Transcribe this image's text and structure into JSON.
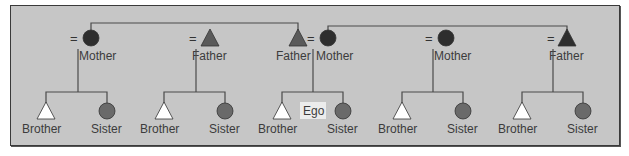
{
  "diagram": {
    "colors": {
      "background": "#c6c6c6",
      "border": "#3a3a3a",
      "line": "#4a4a4a",
      "parent_dark": "#2e2e2e",
      "parent_mid": "#5a5a5a",
      "sibling_female": "#6a6a6a",
      "sibling_male": "#ffffff",
      "ego_box": "#ececec"
    },
    "symbol_legend": {
      "triangle": "male",
      "circle": "female",
      "equals": "marriage"
    },
    "parents": [
      {
        "id": "p1",
        "label": "Mother",
        "shape": "circle",
        "x": 91,
        "y": 38,
        "eq_x": 75
      },
      {
        "id": "p2",
        "label": "Father",
        "shape": "triangle",
        "x": 210,
        "y": 38,
        "eq_x": 194
      },
      {
        "id": "p3",
        "label": "Father",
        "shape": "triangle",
        "x": 298,
        "y": 38,
        "eq_x": 312
      },
      {
        "id": "p4",
        "label": "Mother",
        "shape": "circle",
        "x": 328,
        "y": 38,
        "eq_x": 312
      },
      {
        "id": "p5",
        "label": "Mother",
        "shape": "circle",
        "x": 446,
        "y": 38,
        "eq_x": 430
      },
      {
        "id": "p6",
        "label": "Father",
        "shape": "triangle",
        "x": 567,
        "y": 38,
        "eq_x": 552
      }
    ],
    "families": [
      {
        "drop_x": 78,
        "children": [
          {
            "label": "Brother",
            "shape": "triangle",
            "x": 46
          },
          {
            "label": "Sister",
            "shape": "circle",
            "x": 107
          }
        ]
      },
      {
        "drop_x": 196,
        "children": [
          {
            "label": "Brother",
            "shape": "triangle",
            "x": 164
          },
          {
            "label": "Sister",
            "shape": "circle",
            "x": 225
          }
        ]
      },
      {
        "drop_x": 313,
        "children": [
          {
            "label": "Brother",
            "shape": "triangle",
            "x": 282
          },
          {
            "label": "Sister",
            "shape": "circle",
            "x": 343
          }
        ],
        "ego": {
          "label": "Ego",
          "x": 313
        }
      },
      {
        "drop_x": 433,
        "children": [
          {
            "label": "Brother",
            "shape": "triangle",
            "x": 402
          },
          {
            "label": "Sister",
            "shape": "circle",
            "x": 463
          }
        ]
      },
      {
        "drop_x": 553,
        "children": [
          {
            "label": "Brother",
            "shape": "triangle",
            "x": 522
          },
          {
            "label": "Sister",
            "shape": "circle",
            "x": 583
          }
        ]
      }
    ],
    "sibling_lines": [
      {
        "from": "p1",
        "to": "p3",
        "y": 23
      },
      {
        "from": "p4",
        "to": "p6",
        "y": 26
      }
    ]
  }
}
